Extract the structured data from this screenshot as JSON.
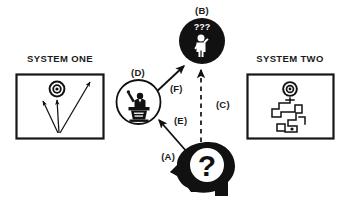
{
  "diagram": {
    "title_system_one": "SYSTEM ONE",
    "title_system_two": "SYSTEM TWO",
    "labels": {
      "a": "(A)",
      "b": "(B)",
      "c": "(C)",
      "d": "(D)",
      "e": "(E)",
      "f": "(F)"
    },
    "glyphs": {
      "question_mark": "?",
      "confusion_marks": "???"
    },
    "colors": {
      "ink": "#111111",
      "frame": "#161616",
      "paper": "#ffffff"
    },
    "nodes": [
      {
        "id": "A",
        "label": "(A)",
        "icon": "head-profile-question-icon",
        "description": "black head silhouette in profile with question mark"
      },
      {
        "id": "B",
        "label": "(B)",
        "icon": "confused-person-circle-icon",
        "description": "filled black circle with white person figure and question marks"
      },
      {
        "id": "D",
        "label": "(D)",
        "icon": "speaker-at-podium-circle-icon",
        "description": "outlined circle with person at a lectern raising an arm"
      }
    ],
    "panels": [
      {
        "id": "system-one",
        "title": "SYSTEM ONE",
        "icon": "bullseye-with-arrows-icon",
        "description": "bullseye target with three straight arrows from one origin"
      },
      {
        "id": "system-two",
        "title": "SYSTEM TWO",
        "icon": "bullseye-with-maze-path-icon",
        "description": "bullseye target above a winding orthogonal maze path"
      }
    ],
    "arrows": [
      {
        "id": "C",
        "label": "(C)",
        "style": "dashed",
        "from": "A",
        "to": "B"
      },
      {
        "id": "E",
        "label": "(E)",
        "style": "solid",
        "from": "A",
        "to": "D"
      },
      {
        "id": "F",
        "label": "(F)",
        "style": "solid",
        "from": "D",
        "to": "B"
      }
    ]
  }
}
